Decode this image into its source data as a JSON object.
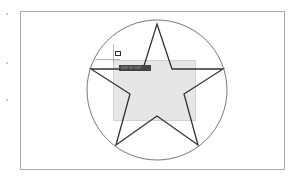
{
  "canvas": {
    "frame": {
      "x": 20,
      "y": 11,
      "w": 265,
      "h": 159,
      "stroke": "#aaaaaa"
    },
    "circle": {
      "cx": 157,
      "cy": 90,
      "r": 70,
      "stroke": "#555555"
    },
    "star": {
      "points": "157,24 172,69 223,69 184,94 198,145 157,116 116,145 130,94 91,69 143,69",
      "stroke": "#333333"
    },
    "selection": {
      "x": 113,
      "y": 60,
      "w": 83,
      "h": 61,
      "fill": "#e6e6e6"
    }
  },
  "tooltip": {
    "label": "### ## ###"
  },
  "side_dots": [
    {
      "y": 13
    },
    {
      "y": 62
    },
    {
      "y": 99
    }
  ]
}
